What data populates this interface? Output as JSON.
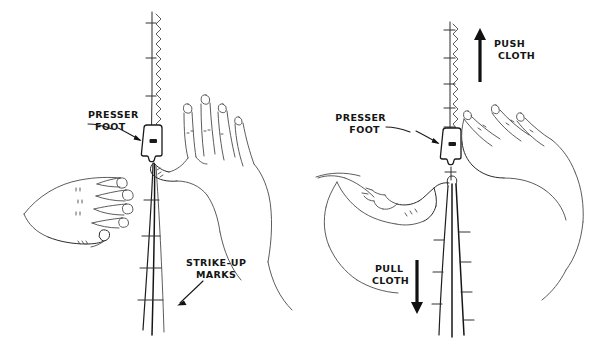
{
  "figure": {
    "background_color": "#ffffff",
    "ink_color": "#2b2b2b",
    "width": 606,
    "height": 357
  },
  "panels": [
    {
      "id": "left-panel",
      "name": "no-stretch-position",
      "labels": {
        "presser_foot": "PRESSER\nFOOT",
        "presser_foot_line1": "PRESSER",
        "presser_foot_line2": "FOOT",
        "strike_up_marks": "STRIKE-UP\nMARKS",
        "strike_up_line1": "STRIKE-UP",
        "strike_up_line2": "MARKS"
      },
      "elements": {
        "seam": "zigzag-stitch-seam",
        "fabric_edges": 3,
        "hands": [
          "flat-left-hand",
          "upright-right-hand"
        ],
        "presser_foot": "presser-foot-icon"
      }
    },
    {
      "id": "right-panel",
      "name": "stretch-position",
      "labels": {
        "presser_foot": "PRESSER\nFOOT",
        "presser_foot_line1": "PRESSER",
        "presser_foot_line2": "FOOT",
        "push_cloth": "PUSH\nCLOTH",
        "push_cloth_line1": "PUSH",
        "push_cloth_line2": "CLOTH",
        "pull_cloth": "PULL\nCLOTH",
        "pull_cloth_line1": "PULL",
        "pull_cloth_line2": "CLOTH"
      },
      "elements": {
        "seam": "zigzag-stitch-seam",
        "fabric_edges": 3,
        "hands": [
          "upper-right-hand-pushing",
          "lower-left-hand-pulling"
        ],
        "presser_foot": "presser-foot-icon",
        "arrows": [
          {
            "name": "push-arrow-up",
            "direction": "up"
          },
          {
            "name": "pull-arrow-down",
            "direction": "down"
          }
        ]
      }
    }
  ]
}
